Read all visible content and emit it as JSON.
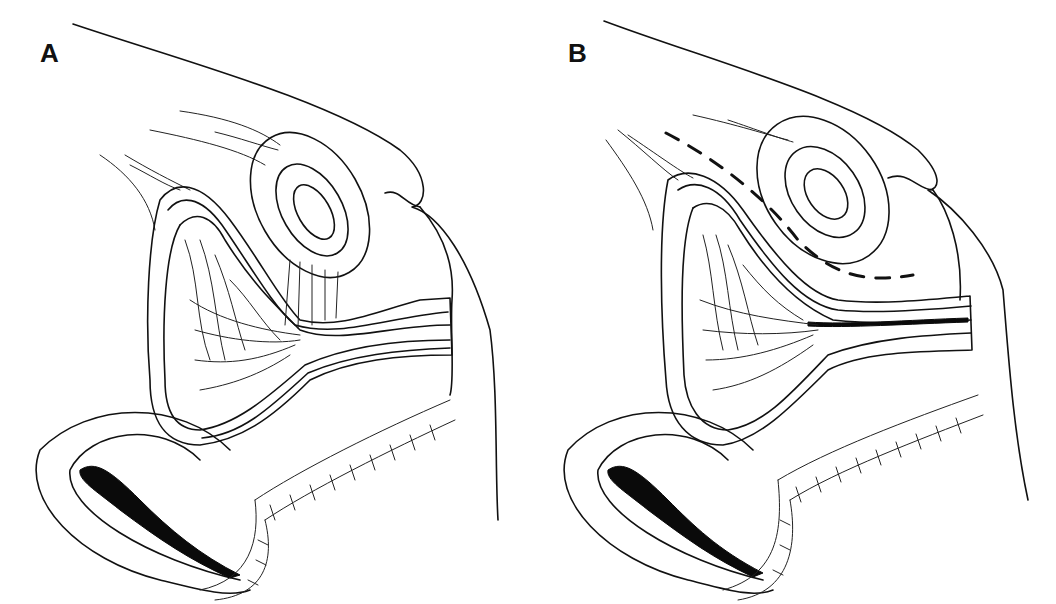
{
  "figure": {
    "panels": [
      {
        "label": "A",
        "description": "Sagittal anatomical section with sutures placed between structures"
      },
      {
        "label": "B",
        "description": "Sagittal anatomical section with dashed incision/plane line"
      }
    ]
  },
  "colors": {
    "line": "#111111",
    "background": "#ffffff"
  }
}
